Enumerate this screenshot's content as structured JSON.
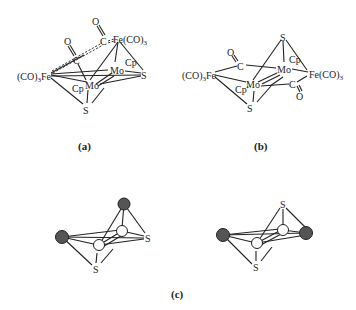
{
  "figure": {
    "panels": [
      {
        "id": "a",
        "caption": "(a)",
        "labels": {
          "fe_left": "(CO)",
          "fe_left_sub": "3",
          "fe_left_tail": "Fe",
          "fe_top": "Fe(CO)",
          "fe_top_sub": "3",
          "c_upper": "C",
          "o_upper": "O",
          "c_lower": "C",
          "o_lower": "O",
          "mo_upper": "Mo",
          "cp_upper": "Cp",
          "s_right": "S",
          "mo_lower": "Mo",
          "cp_lower": "Cp",
          "s_bottom": "S"
        }
      },
      {
        "id": "b",
        "caption": "(b)",
        "labels": {
          "s_top": "S",
          "o_left": "O",
          "c_left": "C",
          "mo_upper": "Mo",
          "cp_upper": "Cp",
          "fe_left": "(CO)",
          "fe_left_sub": "3",
          "fe_left_tail": "Fe",
          "fe_right": "Fe(CO)",
          "fe_right_sub": "3",
          "mo_lower": "Mo",
          "cp_lower": "Cp'",
          "c_right": "C",
          "o_right": "O",
          "s_bottom": "S"
        }
      },
      {
        "id": "c",
        "caption": "(c)",
        "left": {
          "s_right": "S",
          "s_bottom": "S"
        },
        "right": {
          "s_top": "S",
          "s_bottom": "S"
        }
      }
    ],
    "colors": {
      "line": "#222222",
      "dark_atom": "#555555",
      "light_atom": "#ffffff"
    }
  }
}
